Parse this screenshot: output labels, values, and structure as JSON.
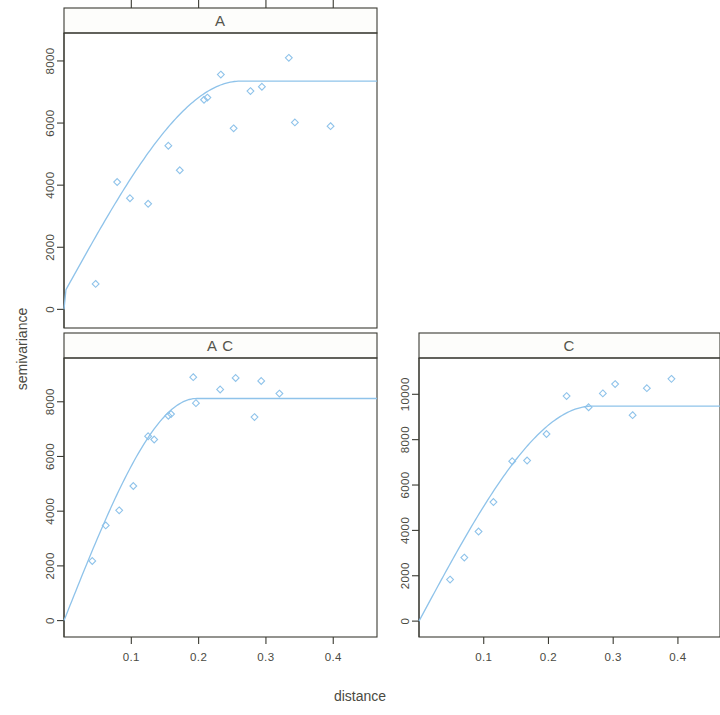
{
  "figure": {
    "xlabel": "distance",
    "ylabel": "semivariance",
    "accent_color": "#8fc3ea",
    "axis_color": "#3b3b33"
  },
  "chart_data": {
    "type": "scatter",
    "title": "",
    "xlabel": "distance",
    "ylabel": "semivariance",
    "grid": false,
    "legend": "none",
    "layout": "lattice 2x2 trellis, panels: A (top-left), A,C (bottom-left), C (bottom-right)",
    "panels": [
      {
        "strip_label": "A",
        "xlim": [
          0.0,
          0.465
        ],
        "ylim": [
          -600,
          8900
        ],
        "xticks": [
          0.1,
          0.2,
          0.3,
          0.4
        ],
        "xticklabels": [
          "0.1",
          "0.2",
          "0.3",
          "0.4"
        ],
        "yticks": [
          0,
          2000,
          4000,
          6000,
          8000
        ],
        "yticklabels": [
          "0",
          "2000",
          "4000",
          "6000",
          "8000"
        ],
        "points": [
          {
            "x": 0.047,
            "y": 820
          },
          {
            "x": 0.079,
            "y": 4100
          },
          {
            "x": 0.098,
            "y": 3580
          },
          {
            "x": 0.125,
            "y": 3400
          },
          {
            "x": 0.155,
            "y": 5270
          },
          {
            "x": 0.172,
            "y": 4480
          },
          {
            "x": 0.208,
            "y": 6750
          },
          {
            "x": 0.213,
            "y": 6820
          },
          {
            "x": 0.233,
            "y": 7560
          },
          {
            "x": 0.252,
            "y": 5830
          },
          {
            "x": 0.277,
            "y": 7030
          },
          {
            "x": 0.294,
            "y": 7170
          },
          {
            "x": 0.334,
            "y": 8100
          },
          {
            "x": 0.343,
            "y": 6020
          },
          {
            "x": 0.396,
            "y": 5900
          }
        ],
        "fit": {
          "model": "spherical",
          "nugget": 520,
          "sill": 7350,
          "range": 0.262
        }
      },
      {
        "strip_label": "A C",
        "xlim": [
          0.0,
          0.465
        ],
        "ylim": [
          -600,
          9600
        ],
        "xticks": [
          0.1,
          0.2,
          0.3,
          0.4
        ],
        "xticklabels": [
          "0.1",
          "0.2",
          "0.3",
          "0.4"
        ],
        "yticks": [
          0,
          2000,
          4000,
          6000,
          8000
        ],
        "yticklabels": [
          "0",
          "2000",
          "4000",
          "6000",
          "8000"
        ],
        "points": [
          {
            "x": 0.042,
            "y": 2180
          },
          {
            "x": 0.062,
            "y": 3480
          },
          {
            "x": 0.082,
            "y": 4030
          },
          {
            "x": 0.103,
            "y": 4920
          },
          {
            "x": 0.125,
            "y": 6740
          },
          {
            "x": 0.134,
            "y": 6620
          },
          {
            "x": 0.155,
            "y": 7490
          },
          {
            "x": 0.159,
            "y": 7550
          },
          {
            "x": 0.192,
            "y": 8900
          },
          {
            "x": 0.196,
            "y": 7950
          },
          {
            "x": 0.232,
            "y": 8450
          },
          {
            "x": 0.255,
            "y": 8870
          },
          {
            "x": 0.283,
            "y": 7440
          },
          {
            "x": 0.293,
            "y": 8760
          },
          {
            "x": 0.32,
            "y": 8300
          }
        ],
        "fit": {
          "model": "spherical",
          "nugget": 0,
          "sill": 8120,
          "range": 0.197
        }
      },
      {
        "strip_label": "C",
        "xlim": [
          0.0,
          0.465
        ],
        "ylim": [
          -700,
          11600
        ],
        "xticks": [
          0.1,
          0.2,
          0.3,
          0.4
        ],
        "xticklabels": [
          "0.1",
          "0.2",
          "0.3",
          "0.4"
        ],
        "yticks": [
          0,
          2000,
          4000,
          6000,
          8000,
          10000
        ],
        "yticklabels": [
          "0",
          "2000",
          "4000",
          "6000",
          "8000",
          "10000"
        ],
        "points": [
          {
            "x": 0.048,
            "y": 1830
          },
          {
            "x": 0.07,
            "y": 2800
          },
          {
            "x": 0.092,
            "y": 3950
          },
          {
            "x": 0.115,
            "y": 5250
          },
          {
            "x": 0.144,
            "y": 7050
          },
          {
            "x": 0.167,
            "y": 7080
          },
          {
            "x": 0.197,
            "y": 8250
          },
          {
            "x": 0.228,
            "y": 9920
          },
          {
            "x": 0.262,
            "y": 9430
          },
          {
            "x": 0.284,
            "y": 10040
          },
          {
            "x": 0.303,
            "y": 10450
          },
          {
            "x": 0.33,
            "y": 9080
          },
          {
            "x": 0.352,
            "y": 10270
          },
          {
            "x": 0.39,
            "y": 10680
          }
        ],
        "fit": {
          "model": "spherical",
          "nugget": 0,
          "sill": 9480,
          "range": 0.268
        }
      }
    ]
  }
}
